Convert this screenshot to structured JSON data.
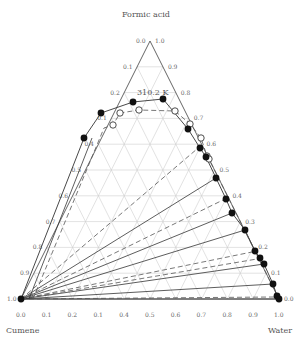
{
  "chart_data": {
    "type": "ternary",
    "title": "",
    "annotation": "310.2 K",
    "vertices": {
      "top": "Formic acid",
      "left": "Cumene",
      "right": "Water"
    },
    "axes": {
      "left_ticks": [
        "0.0",
        "0.1",
        "0.2",
        "0.1",
        "0.4",
        "0.5",
        "0.6",
        "0.7",
        "0.8",
        "0.9",
        "1.0"
      ],
      "right_ticks": [
        "1.0",
        "0.9",
        "0.8",
        "0.7",
        "0.6",
        "0.5",
        "0.4",
        "0.3",
        "0.2",
        "0.1",
        "0.0"
      ],
      "bottom_ticks": [
        "0.0",
        "0.1",
        "0.2",
        "0.1",
        "0.4",
        "0.5",
        "0.6",
        "0.7",
        "0.8",
        "0.9",
        "1.0"
      ]
    },
    "grid": true,
    "series": [
      {
        "name": "experimental",
        "marker": "filled-circle",
        "points_screen": [
          [
            21,
            299
          ],
          [
            84,
            138
          ],
          [
            101,
            113
          ],
          [
            133,
            102
          ],
          [
            163,
            99
          ],
          [
            188,
            129
          ],
          [
            200,
            148
          ],
          [
            206,
            157
          ],
          [
            216,
            178
          ],
          [
            226,
            199
          ],
          [
            232,
            213
          ],
          [
            245,
            230
          ],
          [
            255,
            251
          ],
          [
            260,
            258
          ],
          [
            264,
            264
          ],
          [
            273,
            284
          ],
          [
            277,
            296
          ],
          [
            279,
            299
          ]
        ]
      },
      {
        "name": "calculated",
        "marker": "open-circle",
        "points_screen": [
          [
            113,
            125
          ],
          [
            120,
            113
          ],
          [
            139,
            110
          ],
          [
            175,
            111
          ],
          [
            190,
            124
          ],
          [
            201,
            138
          ],
          [
            207,
            156
          ],
          [
            209,
            159
          ]
        ]
      }
    ],
    "tie_lines_solid_end": [
      [
        216,
        178
      ],
      [
        232,
        213
      ],
      [
        245,
        230
      ],
      [
        264,
        264
      ],
      [
        273,
        284
      ],
      [
        279,
        299
      ]
    ],
    "tie_lines_dashed_end": [
      [
        200,
        148
      ],
      [
        226,
        199
      ],
      [
        255,
        251
      ],
      [
        260,
        258
      ],
      [
        277,
        296
      ]
    ]
  },
  "labels": {
    "top": "Formic acid",
    "left": "Cumene",
    "right": "Water",
    "temperature": "310.2 K"
  }
}
